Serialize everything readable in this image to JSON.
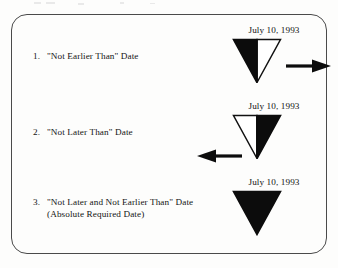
{
  "figure": {
    "background_color": "#fdfdfc",
    "frame_color": "#4a4a4a",
    "ink_color": "#131313",
    "rows": [
      {
        "number": "1.",
        "label": "\"Not Earlier Than\" Date",
        "label_line2": "",
        "date": "July 10, 1993",
        "symbol": "half-black-left-triangle-down",
        "fill_left": "black",
        "fill_right": "white",
        "arrow": "arrow-right-icon",
        "arrow_direction": "right"
      },
      {
        "number": "2.",
        "label": "\"Not Later Than\" Date",
        "label_line2": "",
        "date": "July 10, 1993",
        "symbol": "half-black-right-triangle-down",
        "fill_left": "white",
        "fill_right": "black",
        "arrow": "arrow-left-icon",
        "arrow_direction": "left"
      },
      {
        "number": "3.",
        "label": "\"Not Later and Not Earlier Than\" Date",
        "label_line2": "(Absolute Required Date)",
        "date": "July 10, 1993",
        "symbol": "solid-black-triangle-down",
        "fill_left": "black",
        "fill_right": "black",
        "arrow": "",
        "arrow_direction": "none"
      }
    ]
  }
}
